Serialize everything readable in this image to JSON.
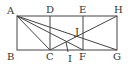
{
  "diagram": {
    "type": "geometry",
    "points": {
      "A": [
        17,
        16
      ],
      "B": [
        17,
        50
      ],
      "C": [
        50,
        50
      ],
      "D": [
        50,
        16
      ],
      "E": [
        83,
        16
      ],
      "F": [
        83,
        50
      ],
      "G": [
        117,
        50
      ],
      "H": [
        117,
        16
      ],
      "I": [
        66,
        41
      ],
      "J": [
        76,
        37
      ]
    },
    "labels": [
      "A",
      "B",
      "C",
      "D",
      "E",
      "F",
      "G",
      "H",
      "I",
      "J"
    ],
    "stroke_color": "#444444"
  }
}
